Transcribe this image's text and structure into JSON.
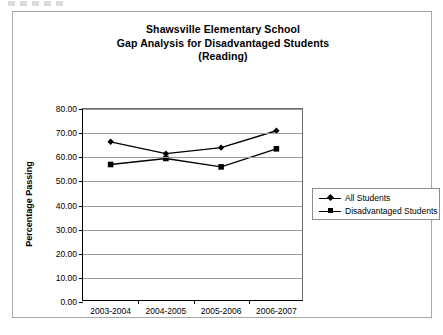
{
  "chart_data": {
    "type": "line",
    "title": "Shawsville Elementary School Gap Analysis for Disadvantaged Students (Reading)",
    "title_lines": [
      "Shawsville Elementary School",
      "Gap Analysis for Disadvantaged Students",
      "(Reading)"
    ],
    "xlabel": "",
    "ylabel": "Percentage Passing",
    "categories": [
      "2003-2004",
      "2004-2005",
      "2005-2006",
      "2006-2007"
    ],
    "series": [
      {
        "name": "All Students",
        "marker": "diamond",
        "color": "#000000",
        "values": [
          66.4,
          61.5,
          64.0,
          71.0
        ]
      },
      {
        "name": "Disadvantaged Students",
        "marker": "square",
        "color": "#000000",
        "values": [
          57.0,
          59.5,
          56.0,
          63.5
        ]
      }
    ],
    "ylim": [
      0,
      80
    ],
    "ytick_step": 10,
    "ytick_labels": [
      "80.00",
      "70.00",
      "60.00",
      "50.00",
      "40.00",
      "30.00",
      "20.00",
      "10.00",
      "0.00"
    ],
    "ytick_values": [
      80,
      70,
      60,
      50,
      40,
      30,
      20,
      10,
      0
    ],
    "grid": true,
    "legend_position": "right"
  }
}
